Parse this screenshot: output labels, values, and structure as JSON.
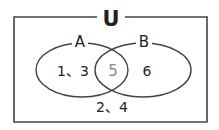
{
  "diagram": {
    "type": "venn",
    "universe_label": "U",
    "sets": [
      {
        "name": "A",
        "only_elements": "1、3"
      },
      {
        "name": "B",
        "only_elements": "6"
      }
    ],
    "intersection": {
      "elements": "5",
      "color": "#888888"
    },
    "outside": {
      "elements": "2、4"
    },
    "colors": {
      "stroke": "#444444",
      "text": "#222222",
      "background": "#ffffff"
    }
  }
}
